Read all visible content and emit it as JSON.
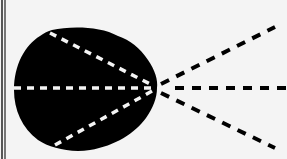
{
  "diagram": {
    "colors": {
      "background": "#f4f4f4",
      "blob": "#000000",
      "inner_dashes": "#f4f4f4",
      "outer_dashes": "#000000",
      "border": "#222222"
    },
    "focal_point": {
      "x": 157,
      "y": 88
    },
    "lines": [
      {
        "name": "upper-inner",
        "from": [
          50,
          32
        ],
        "to": [
          155,
          86
        ],
        "color": "white"
      },
      {
        "name": "middle-inner",
        "from": [
          14,
          88
        ],
        "to": [
          152,
          88
        ],
        "color": "white"
      },
      {
        "name": "lower-inner",
        "from": [
          55,
          145
        ],
        "to": [
          155,
          90
        ],
        "color": "white"
      },
      {
        "name": "upper-outer",
        "from": [
          160,
          85
        ],
        "to": [
          275,
          27
        ],
        "color": "black"
      },
      {
        "name": "middle-outer",
        "from": [
          175,
          88
        ],
        "to": [
          287,
          88
        ],
        "color": "black"
      },
      {
        "name": "lower-outer",
        "from": [
          160,
          92
        ],
        "to": [
          275,
          148
        ],
        "color": "black"
      }
    ]
  }
}
